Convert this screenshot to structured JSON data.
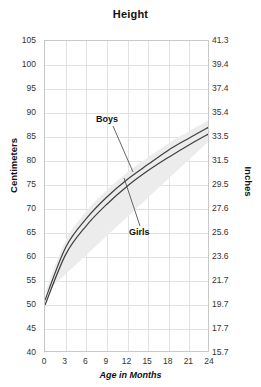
{
  "chart_data": {
    "type": "line",
    "title": "Height",
    "xlabel": "Age in Months",
    "ylabel": "Centimeters",
    "ylabel_secondary": "Inches",
    "grid": true,
    "legend_position": "inline-annotations",
    "xlim": [
      0,
      24
    ],
    "ylim": [
      40,
      105
    ],
    "ylim_secondary": [
      15.7,
      41.3
    ],
    "xticks": [
      "0",
      "3",
      "6",
      "9",
      "12",
      "15",
      "18",
      "21",
      "24"
    ],
    "yticks": [
      "105",
      "100",
      "95",
      "90",
      "85",
      "80",
      "75",
      "70",
      "65",
      "60",
      "55",
      "50",
      "45",
      "40"
    ],
    "yticks_secondary": [
      "41.3",
      "39.4",
      "37.4",
      "35.4",
      "33.5",
      "31.5",
      "29.5",
      "27.6",
      "25.6",
      "23.6",
      "21.7",
      "19.7",
      "17.7",
      "15.7"
    ],
    "x": [
      0,
      3,
      6,
      9,
      12,
      15,
      18,
      21,
      24
    ],
    "series": [
      {
        "name": "Boys",
        "values": [
          51.0,
          62.0,
          68.0,
          72.5,
          76.2,
          79.3,
          82.3,
          84.8,
          87.2
        ]
      },
      {
        "name": "Girls",
        "values": [
          50.0,
          60.5,
          66.5,
          71.0,
          74.8,
          78.0,
          80.8,
          83.4,
          85.8
        ]
      }
    ],
    "annotations": [
      {
        "label": "Boys",
        "target_series": "Boys"
      },
      {
        "label": "Girls",
        "target_series": "Girls"
      }
    ],
    "colors": {
      "boys_line": "#3f3f3f",
      "girls_line": "#3f3f3f",
      "band": "#ececec",
      "grid": "#e2e2e2",
      "frame": "#c8c8c8",
      "text": "#333333"
    }
  }
}
